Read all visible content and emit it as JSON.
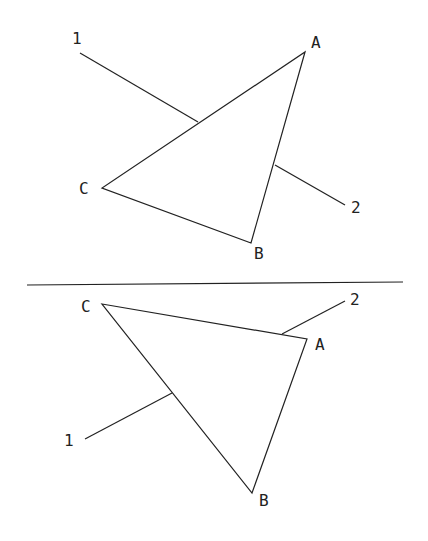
{
  "diagram": {
    "top": {
      "vertices": {
        "A": "A",
        "B": "B",
        "C": "C"
      },
      "lines": {
        "one": "1",
        "two": "2"
      }
    },
    "bottom": {
      "vertices": {
        "A": "A",
        "B": "B",
        "C": "C"
      },
      "lines": {
        "one": "1",
        "two": "2"
      }
    }
  }
}
